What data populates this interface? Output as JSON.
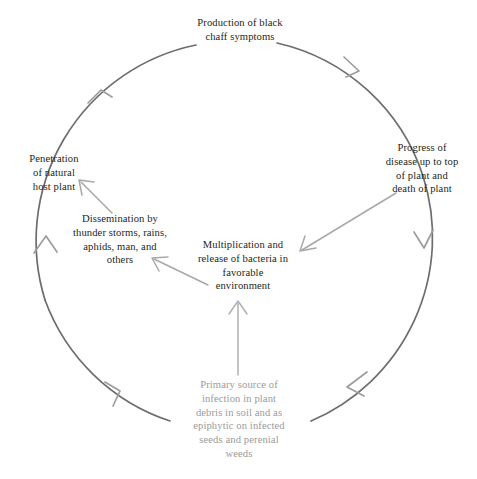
{
  "diagram": {
    "nodes": [
      {
        "id": "production",
        "text": "Production of black\nchaff symptoms",
        "color": "#231f20"
      },
      {
        "id": "progress",
        "text": "Progress of\ndisease up to top\nof plant and\ndeath of plant",
        "color": "#231f20"
      },
      {
        "id": "penetration",
        "text": "Penetration\nof natural\nhost plant",
        "color": "#231f20"
      },
      {
        "id": "dissemination",
        "text": "Dissemination by\nthunder storms, rains,\naphids, man, and\nothers",
        "color": "#231f20"
      },
      {
        "id": "multiplication",
        "text": "Multiplication and\nrelease of bacteria in\nfavorable\nenvironment",
        "color": "#231f20"
      },
      {
        "id": "primary_source",
        "text": "Primary source of\ninfection in plant\ndebris in soil and as\nepiphytic on infected\nseeds and perenial\nweeds",
        "color": "#9b9b9b"
      }
    ],
    "colors": {
      "arc": "#6d6d6d",
      "arrow_light": "#a8a8a8",
      "text_dark": "#231f20",
      "text_light": "#9b9b9b",
      "background": "#ffffff"
    },
    "connectors": [
      {
        "id": "arc-top-right",
        "from": "production",
        "to": "progress"
      },
      {
        "id": "arc-right-bottom",
        "from": "progress",
        "to": "primary_source"
      },
      {
        "id": "arc-bottom-left",
        "from": "primary_source",
        "to": "penetration"
      },
      {
        "id": "arc-left-top",
        "from": "penetration",
        "to": "production"
      },
      {
        "id": "arrow-progress-to-multiplication",
        "from": "progress",
        "to": "multiplication"
      },
      {
        "id": "arrow-primary-to-multiplication",
        "from": "primary_source",
        "to": "multiplication"
      },
      {
        "id": "arrow-multiplication-to-dissemination",
        "from": "multiplication",
        "to": "dissemination"
      },
      {
        "id": "arrow-dissemination-to-penetration",
        "from": "dissemination",
        "to": "penetration"
      }
    ]
  }
}
